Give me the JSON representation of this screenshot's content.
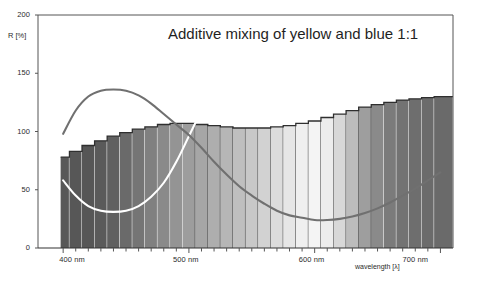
{
  "chart_data": {
    "type": "area",
    "title": "Additive mixing of yellow and blue 1:1",
    "xlabel": "wavelength [λ]",
    "ylabel": "R [%]",
    "xlim": [
      380,
      710
    ],
    "ylim": [
      0,
      200
    ],
    "grid": false,
    "legend": "none",
    "y_ticks": [
      0,
      50,
      100,
      150,
      200
    ],
    "y_tick_labels": [
      "0",
      "50",
      "100",
      "150",
      "200"
    ],
    "x_ticks": [
      400,
      500,
      600,
      700
    ],
    "x_tick_labels": [
      "400 nm",
      "500 nm",
      "600 nm",
      "700 nm"
    ],
    "x_minor_tick_step": 10,
    "series": [
      {
        "name": "additive mixture (bars, spectral fill)",
        "render": "bars",
        "x": [
          400,
          410,
          420,
          430,
          440,
          450,
          460,
          470,
          480,
          490,
          500,
          510,
          520,
          530,
          540,
          550,
          560,
          570,
          580,
          590,
          600,
          610,
          620,
          630,
          640,
          650,
          660,
          670,
          680,
          690,
          700
        ],
        "values": [
          78,
          83,
          88,
          92,
          96,
          99,
          102,
          104,
          106,
          107,
          107,
          106,
          105,
          104,
          103,
          103,
          103,
          104,
          105,
          107,
          109,
          112,
          115,
          118,
          121,
          123,
          125,
          127,
          128,
          129,
          130
        ],
        "bar_fill_grays": [
          "#585858",
          "#575757",
          "#565656",
          "#5a5a5a",
          "#606060",
          "#6a6a6a",
          "#757575",
          "#808080",
          "#8a8a8a",
          "#949494",
          "#9d9d9d",
          "#a6a6a6",
          "#aeaeae",
          "#b6b6b6",
          "#bfbfbf",
          "#c8c8c8",
          "#d2d2d2",
          "#dcdcdc",
          "#e6e6e6",
          "#efefef",
          "#f4f4f4",
          "#ededed",
          "#d8d8d8",
          "#bcbcbc",
          "#9e9e9e",
          "#8a8a8a",
          "#7b7b7b",
          "#737373",
          "#6e6e6e",
          "#6b6b6b",
          "#6a6a6a"
        ]
      },
      {
        "name": "yellow component",
        "render": "line",
        "color": "#ffffff",
        "x": [
          400,
          410,
          420,
          430,
          440,
          450,
          460,
          470,
          480,
          490,
          500,
          510,
          520,
          530,
          540,
          550,
          560,
          570,
          580,
          590,
          600,
          610,
          620,
          630,
          640,
          650,
          660,
          670,
          680,
          690,
          700
        ],
        "values": [
          58,
          45,
          36,
          32,
          31,
          32,
          36,
          44,
          56,
          74,
          96,
          118,
          140,
          158,
          172,
          183,
          192,
          199,
          205,
          210,
          213,
          216,
          218,
          220,
          222,
          224,
          226,
          228,
          230,
          231,
          232
        ]
      },
      {
        "name": "blue component",
        "render": "line",
        "color": "#707070",
        "x": [
          400,
          410,
          420,
          430,
          440,
          450,
          460,
          470,
          480,
          490,
          500,
          510,
          520,
          530,
          540,
          550,
          560,
          570,
          580,
          590,
          600,
          610,
          620,
          630,
          640,
          650,
          660,
          670,
          680,
          690,
          700
        ],
        "values": [
          98,
          118,
          130,
          135,
          136,
          135,
          131,
          124,
          115,
          106,
          97,
          86,
          74,
          63,
          53,
          45,
          38,
          32,
          28,
          26,
          24,
          24,
          25,
          27,
          30,
          34,
          39,
          45,
          51,
          58,
          65
        ]
      }
    ]
  }
}
